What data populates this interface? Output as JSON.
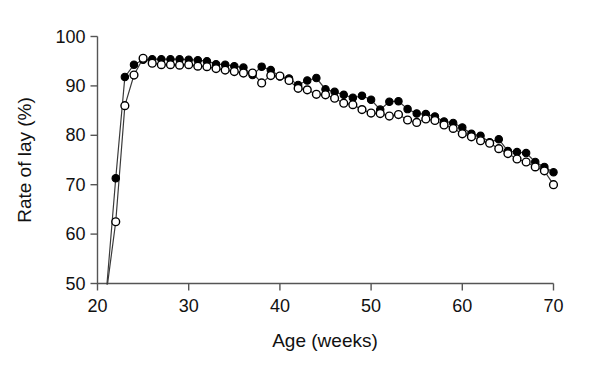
{
  "chart_data": {
    "type": "line",
    "title": "",
    "subtitle": "",
    "xlabel": "Age (weeks)",
    "ylabel": "Rate of lay (%)",
    "xlim": [
      20,
      70
    ],
    "ylim": [
      50,
      100
    ],
    "xticks": [
      20,
      30,
      40,
      50,
      60,
      70
    ],
    "yticks": [
      50,
      60,
      70,
      80,
      90,
      100
    ],
    "xtick_labels": [
      "20",
      "30",
      "40",
      "50",
      "60",
      "70"
    ],
    "ytick_labels": [
      "50",
      "60",
      "70",
      "80",
      "90",
      "100"
    ],
    "grid": false,
    "legend": "none",
    "marker_styles": {
      "filled": "filled-circle-black",
      "open": "open-circle-white"
    },
    "x": [
      21,
      22,
      23,
      24,
      25,
      26,
      27,
      28,
      29,
      30,
      31,
      32,
      33,
      34,
      35,
      36,
      37,
      38,
      39,
      40,
      41,
      42,
      43,
      44,
      45,
      46,
      47,
      48,
      49,
      50,
      51,
      52,
      53,
      54,
      55,
      56,
      57,
      58,
      59,
      60,
      61,
      62,
      63,
      64,
      65,
      66,
      67,
      68,
      69,
      70
    ],
    "series": [
      {
        "name": "filled",
        "marker": "filled-circle",
        "values": [
          49.0,
          71.3,
          91.8,
          94.3,
          95.3,
          95.4,
          95.4,
          95.4,
          95.4,
          95.3,
          95.2,
          95.0,
          94.4,
          94.3,
          94.0,
          93.7,
          92.2,
          93.9,
          93.2,
          91.9,
          91.5,
          90.2,
          91.1,
          91.6,
          89.3,
          88.8,
          88.2,
          87.6,
          88.0,
          87.2,
          85.2,
          86.8,
          86.9,
          85.3,
          84.4,
          84.3,
          83.8,
          82.8,
          82.5,
          81.6,
          80.3,
          79.9,
          78.6,
          79.2,
          76.8,
          76.6,
          76.4,
          74.6,
          73.6,
          72.5
        ]
      },
      {
        "name": "open",
        "marker": "open-circle",
        "values": [
          48.5,
          62.5,
          86.0,
          92.2,
          95.6,
          94.6,
          94.3,
          94.3,
          94.2,
          94.3,
          94.0,
          93.9,
          93.5,
          93.2,
          92.9,
          92.6,
          92.6,
          90.6,
          92.1,
          92.0,
          91.1,
          89.5,
          89.2,
          88.3,
          88.2,
          87.5,
          86.5,
          86.2,
          85.2,
          84.5,
          84.4,
          83.9,
          84.2,
          83.1,
          82.6,
          83.3,
          83.0,
          82.1,
          81.4,
          80.3,
          79.7,
          78.9,
          78.4,
          77.3,
          76.3,
          75.2,
          74.6,
          73.6,
          72.8,
          70.0
        ]
      }
    ]
  }
}
